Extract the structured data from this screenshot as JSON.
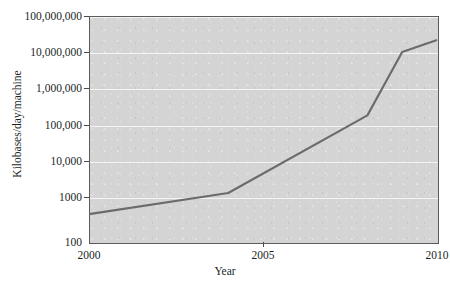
{
  "chart_data": {
    "type": "line",
    "title": "",
    "xlabel": "Year",
    "ylabel": "Kilobases/day/machine",
    "yscale": "log",
    "xlim": [
      2000,
      2010
    ],
    "ylim": [
      100,
      100000000
    ],
    "grid": true,
    "legend": null,
    "x_ticks": [
      "2000",
      "2005",
      "2010"
    ],
    "x_tick_values": [
      2000,
      2005,
      2010
    ],
    "y_ticks": [
      "100",
      "1000",
      "10,000",
      "100,000",
      "1,000,000",
      "10,000,000",
      "100,000,000"
    ],
    "y_tick_values": [
      100,
      1000,
      10000,
      100000,
      1000000,
      10000000,
      100000000
    ],
    "series": [
      {
        "name": "Sequencing throughput",
        "x": [
          2000,
          2004,
          2008,
          2009,
          2010
        ],
        "values": [
          550,
          2000,
          230000,
          11000000,
          23000000
        ]
      }
    ]
  },
  "axes": {
    "y_label": "Kilobases/day/machine",
    "x_label": "Year"
  },
  "style": {
    "plot_background": "#d4d4d4",
    "gridline_color": "#f4f4f4",
    "line_color": "#6b6b6b",
    "axis_color": "#5c5c5c",
    "text_color": "#221f1f",
    "page_background": "#ffffff"
  }
}
